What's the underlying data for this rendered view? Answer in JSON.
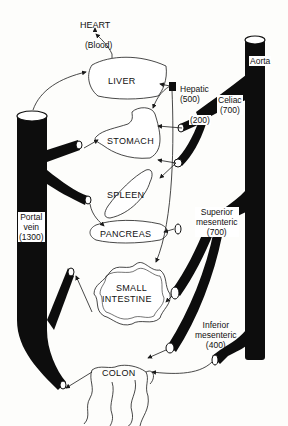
{
  "diagram": {
    "type": "anatomical blood flow diagram",
    "heart": {
      "title": "HEART",
      "subtitle": "(Blood)"
    },
    "organs": {
      "liver": "LIVER",
      "stomach": "STOMACH",
      "spleen": "SPLEEN",
      "pancreas": "PANCREAS",
      "small_intestine_line1": "SMALL",
      "small_intestine_line2": "INTESTINE",
      "colon": "COLON"
    },
    "vessels": {
      "aorta": "Aorta",
      "hepatic": {
        "name": "Hepatic",
        "flow": "(500)"
      },
      "celiac": {
        "name": "Celiac",
        "flow": "(700)"
      },
      "celiac_branch": {
        "flow": "(200)"
      },
      "superior_mesenteric": {
        "line1": "Superior",
        "line2": "mesenteric",
        "flow": "(700)"
      },
      "inferior_mesenteric": {
        "line1": "Inferior",
        "line2": "mesenteric",
        "flow": "(400)"
      },
      "portal_vein": {
        "line1": "Portal",
        "line2": "vein",
        "flow": "(1300)"
      }
    },
    "colors": {
      "vessel": "#0d0d0d",
      "background": "#fdfdfb",
      "line": "#1a1a1a"
    }
  }
}
